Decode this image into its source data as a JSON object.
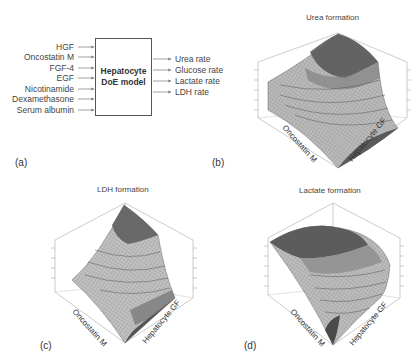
{
  "panel_a": {
    "label": "(a)",
    "inputs": [
      "HGF",
      "Oncostatin M",
      "FGF-4",
      "EGF",
      "Nicotinamide",
      "Dexamethasone",
      "Serum albumin"
    ],
    "model_title_line1": "Hepatocyte",
    "model_title_line2": "DoE model",
    "outputs": [
      "Urea rate",
      "Glucose rate",
      "Lactate rate",
      "LDH rate"
    ]
  },
  "panel_b": {
    "label": "(b)",
    "title": "Urea formation",
    "x_axis": "Oncostatin M",
    "y_axis": "Hepatocyte GF",
    "z_axis": "Urea",
    "surface_shape": "saddle-rising toward back corner"
  },
  "panel_c": {
    "label": "(c)",
    "title": "LDH formation",
    "x_axis": "Oncostatin M",
    "y_axis": "Hepatocyte GF",
    "z_axis": "LDH",
    "surface_shape": "rising toward back corner"
  },
  "panel_d": {
    "label": "(d)",
    "title": "Lactate formation",
    "x_axis": "Oncostatin M",
    "y_axis": "Hepatocyte GF",
    "z_axis": "Lactate",
    "surface_shape": "dome with maximum at back-left"
  },
  "colors": {
    "dark_band": "#555555",
    "mid_band": "#8a8a8a",
    "light_band": "#c8c8c8",
    "box_axis": "#999999",
    "text": "#333333"
  }
}
